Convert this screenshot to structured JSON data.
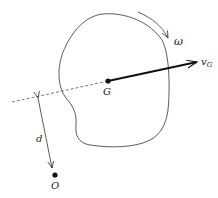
{
  "diagram": {
    "type": "rigid-body-kinematics",
    "labels": {
      "omega": "ω",
      "velocity": "v",
      "velocity_subscript": "G",
      "center_of_mass": "G",
      "distance": "d",
      "origin": "O"
    },
    "colors": {
      "stroke": "#333333",
      "velocity_arrow": "#111111",
      "background": "#ffffff"
    }
  }
}
